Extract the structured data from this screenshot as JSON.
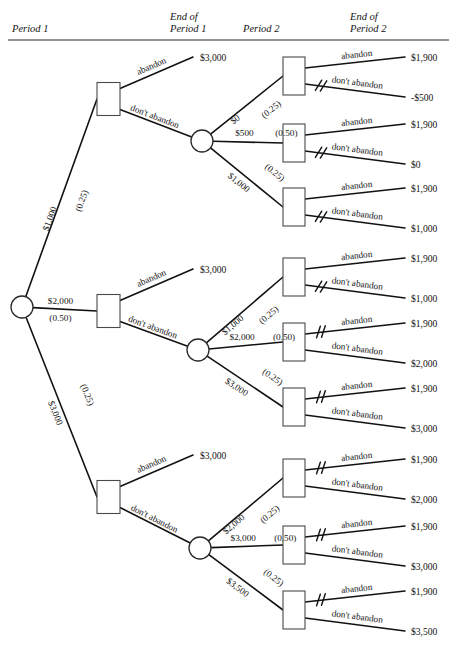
{
  "figure": {
    "headers": [
      {
        "line1": "Period 1",
        "line2": ""
      },
      {
        "line1": "End of",
        "line2": "Period 1"
      },
      {
        "line1": "Period 2",
        "line2": ""
      },
      {
        "line1": "End of",
        "line2": "Period 2"
      }
    ],
    "actions": {
      "abandon": "abandon",
      "dont_abandon": "don't abandon"
    },
    "abandon_payoff_period1": "$3,000",
    "abandon_payoff_period2": "$1,900"
  },
  "chart_data": {
    "type": "diagram",
    "diagram_kind": "decision-tree",
    "node_shapes": {
      "decision": "square",
      "chance": "circle"
    },
    "root": {
      "id": "root",
      "type": "chance",
      "label": "",
      "branches": [
        {
          "value": "$1,000",
          "probability": "(0.25)",
          "p": 0.25
        },
        {
          "value": "$2,000",
          "probability": "(0.50)",
          "p": 0.5
        },
        {
          "value": "$3,000",
          "probability": "(0.25)",
          "p": 0.25
        }
      ]
    },
    "period1_decisions": [
      {
        "id": "d1",
        "abandon_payoff": "$3,000",
        "chance_branches": [
          {
            "value": "$0",
            "probability": "(0.25)",
            "p": 0.25
          },
          {
            "value": "$500",
            "probability": "(0.50)",
            "p": 0.5
          },
          {
            "value": "$1,000",
            "probability": "(0.25)",
            "p": 0.25
          }
        ]
      },
      {
        "id": "d2",
        "abandon_payoff": "$3,000",
        "chance_branches": [
          {
            "value": "$1,000",
            "probability": "(0.25)",
            "p": 0.25
          },
          {
            "value": "$2,000",
            "probability": "(0.50)",
            "p": 0.5
          },
          {
            "value": "$3,000",
            "probability": "(0.25)",
            "p": 0.25
          }
        ]
      },
      {
        "id": "d3",
        "abandon_payoff": "$3,000",
        "chance_branches": [
          {
            "value": "$2,000",
            "probability": "(0.25)",
            "p": 0.25
          },
          {
            "value": "$3,000",
            "probability": "(0.50)",
            "p": 0.5
          },
          {
            "value": "$3,500",
            "probability": "(0.25)",
            "p": 0.25
          }
        ]
      }
    ],
    "period2_decisions": [
      {
        "id": "t1",
        "abandon_payoff": "$1,900",
        "dont_abandon_payoff": "-$500",
        "pruned": "dont_abandon"
      },
      {
        "id": "t2",
        "abandon_payoff": "$1,900",
        "dont_abandon_payoff": "$0",
        "pruned": "dont_abandon"
      },
      {
        "id": "t3",
        "abandon_payoff": "$1,900",
        "dont_abandon_payoff": "$1,000",
        "pruned": "dont_abandon"
      },
      {
        "id": "t4",
        "abandon_payoff": "$1,900",
        "dont_abandon_payoff": "$1,000",
        "pruned": "dont_abandon"
      },
      {
        "id": "t5",
        "abandon_payoff": "$1,900",
        "dont_abandon_payoff": "$2,000",
        "pruned": "abandon"
      },
      {
        "id": "t6",
        "abandon_payoff": "$1,900",
        "dont_abandon_payoff": "$3,000",
        "pruned": "abandon"
      },
      {
        "id": "t7",
        "abandon_payoff": "$1,900",
        "dont_abandon_payoff": "$2,000",
        "pruned": "abandon"
      },
      {
        "id": "t8",
        "abandon_payoff": "$1,900",
        "dont_abandon_payoff": "$3,000",
        "pruned": "abandon"
      },
      {
        "id": "t9",
        "abandon_payoff": "$1,900",
        "dont_abandon_payoff": "$3,500",
        "pruned": "abandon"
      }
    ]
  }
}
